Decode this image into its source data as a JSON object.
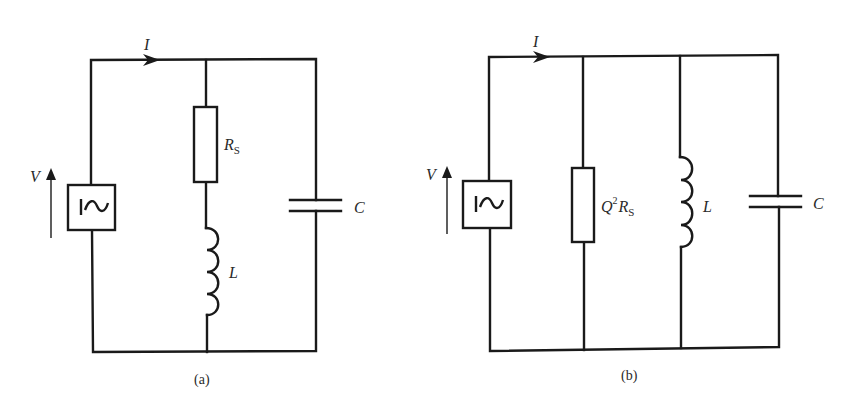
{
  "figure": {
    "panels": [
      {
        "id": "a",
        "caption": "(a)",
        "current_label": "I",
        "voltage_label": "V",
        "source_symbol": "I~",
        "components": [
          {
            "type": "resistor",
            "label": "R",
            "subscript": "S",
            "branch": "series with inductor"
          },
          {
            "type": "inductor",
            "label": "L",
            "branch": "series with resistor"
          },
          {
            "type": "capacitor",
            "label": "C",
            "branch": "parallel"
          }
        ],
        "description": "AC source feeding series R_S–L branch in parallel with capacitor C"
      },
      {
        "id": "b",
        "caption": "(b)",
        "current_label": "I",
        "voltage_label": "V",
        "source_symbol": "I~",
        "components": [
          {
            "type": "resistor",
            "label_prefix": "Q",
            "superscript": "2",
            "label": "R",
            "subscript": "S",
            "branch": "parallel"
          },
          {
            "type": "inductor",
            "label": "L",
            "branch": "parallel"
          },
          {
            "type": "capacitor",
            "label": "C",
            "branch": "parallel"
          }
        ],
        "description": "AC source feeding parallel Q²R_S, L and C"
      }
    ]
  },
  "colors": {
    "ink": "#1a1a1a",
    "background": "#ffffff"
  }
}
